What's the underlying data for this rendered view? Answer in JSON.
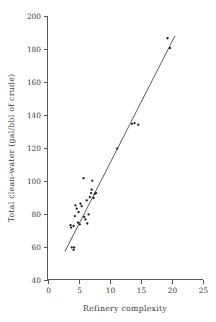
{
  "chart_data": {
    "type": "scatter",
    "title": "",
    "xlabel": "Refinery complexity",
    "ylabel": "Total clean-water (gal/bbl of crude)",
    "xlim": [
      0,
      25
    ],
    "ylim": [
      40,
      200
    ],
    "xticks": [
      0,
      5,
      10,
      15,
      20,
      25
    ],
    "yticks": [
      40,
      60,
      80,
      100,
      120,
      140,
      160,
      180,
      200
    ],
    "xtick_labels": [
      "0",
      "5",
      "10",
      "15",
      "20",
      "25"
    ],
    "ytick_labels": [
      "40",
      "60",
      "80",
      "100",
      "120",
      "140",
      "160",
      "180",
      "200"
    ],
    "grid": false,
    "legend": false,
    "points": [
      [
        3.7,
        73.0
      ],
      [
        3.8,
        71.5
      ],
      [
        3.9,
        59.5
      ],
      [
        4.2,
        58.0
      ],
      [
        4.3,
        59.5
      ],
      [
        4.2,
        72.5
      ],
      [
        4.4,
        78.5
      ],
      [
        4.5,
        85.0
      ],
      [
        4.7,
        83.0
      ],
      [
        4.9,
        74.5
      ],
      [
        5.0,
        81.0
      ],
      [
        5.2,
        73.5
      ],
      [
        5.3,
        86.0
      ],
      [
        5.5,
        84.5
      ],
      [
        5.8,
        101.5
      ],
      [
        5.9,
        78.0
      ],
      [
        6.1,
        76.5
      ],
      [
        6.3,
        88.0
      ],
      [
        6.4,
        74.0
      ],
      [
        6.6,
        79.5
      ],
      [
        6.8,
        90.0
      ],
      [
        7.0,
        92.5
      ],
      [
        7.1,
        94.5
      ],
      [
        7.2,
        100.0
      ],
      [
        7.4,
        89.5
      ],
      [
        7.6,
        92.0
      ],
      [
        7.8,
        92.5
      ],
      [
        11.2,
        119.5
      ],
      [
        13.6,
        134.5
      ],
      [
        14.0,
        135.0
      ],
      [
        14.6,
        134.0
      ],
      [
        19.3,
        186.5
      ],
      [
        19.7,
        180.5
      ]
    ],
    "fit_line": {
      "name": "least-squares fit",
      "x_start": 2.8,
      "y_start": 57.0,
      "x_end": 20.5,
      "y_end": 188.0
    },
    "colors": {
      "point": "#1c1c1c",
      "line": "#4a4a4a",
      "axis": "#585858",
      "text": "#3a3a3a",
      "background": "#ffffff"
    }
  }
}
